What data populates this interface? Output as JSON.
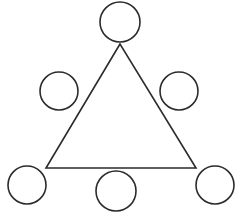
{
  "figure": {
    "title": "Triangle surrounded by six circles",
    "background_color": "#ffffff",
    "stroke_color": "#2b2b2b",
    "stroke_width": 1.6,
    "width": 242,
    "height": 217
  },
  "diagram_data": {
    "type": "geometric-diagram",
    "shape_count": 7,
    "circle_count": 6,
    "triangle_count": 1,
    "fill": "none",
    "triangle": {
      "name": "equilateral-triangle",
      "points": "120,44 46,168 196,168",
      "apex": {
        "x": 120,
        "y": 44
      },
      "bottom_left": {
        "x": 46,
        "y": 168
      },
      "bottom_right": {
        "x": 196,
        "y": 168
      },
      "base_length": 150,
      "height": 124
    },
    "circles": [
      {
        "name": "circle-top-apex",
        "position": "top",
        "cx": 120,
        "cy": 22,
        "r": 20
      },
      {
        "name": "circle-mid-left",
        "position": "middle-left",
        "cx": 59,
        "cy": 91,
        "r": 19
      },
      {
        "name": "circle-mid-right",
        "position": "middle-right",
        "cx": 179,
        "cy": 91,
        "r": 19
      },
      {
        "name": "circle-bottom-left",
        "position": "bottom-left",
        "cx": 27,
        "cy": 185,
        "r": 19
      },
      {
        "name": "circle-bottom-center",
        "position": "bottom-center",
        "cx": 116,
        "cy": 191,
        "r": 20
      },
      {
        "name": "circle-bottom-right",
        "position": "bottom-right",
        "cx": 215,
        "cy": 185,
        "r": 19
      }
    ]
  }
}
